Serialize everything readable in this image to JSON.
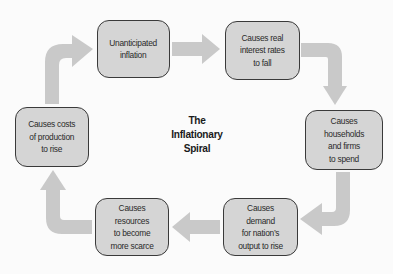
{
  "diagram": {
    "title_lines": [
      "The",
      "Inflationary",
      "Spiral"
    ],
    "type": "cycle",
    "colors": {
      "background": "#fbfbfb",
      "box_fill": "#d5d5d5",
      "box_border": "#3a3a3a",
      "arrow_fill": "#c9c9c9",
      "text": "#2a2a2a"
    },
    "nodes": [
      {
        "id": "unanticipated-inflation",
        "lines": [
          "Unanticipated",
          "inflation"
        ]
      },
      {
        "id": "real-interest-rates-fall",
        "lines": [
          "Causes real",
          "interest rates",
          "to fall"
        ]
      },
      {
        "id": "households-firms-spend",
        "lines": [
          "Causes households",
          "and firms",
          "to spend"
        ]
      },
      {
        "id": "demand-output-rise",
        "lines": [
          "Causes demand",
          "for nation’s",
          "output to rise"
        ]
      },
      {
        "id": "resources-scarce",
        "lines": [
          "Causes resources",
          "to become",
          "more scarce"
        ]
      },
      {
        "id": "costs-production-rise",
        "lines": [
          "Causes costs",
          "of production",
          "to rise"
        ]
      }
    ],
    "edges": [
      {
        "from": "unanticipated-inflation",
        "to": "real-interest-rates-fall"
      },
      {
        "from": "real-interest-rates-fall",
        "to": "households-firms-spend"
      },
      {
        "from": "households-firms-spend",
        "to": "demand-output-rise"
      },
      {
        "from": "demand-output-rise",
        "to": "resources-scarce"
      },
      {
        "from": "resources-scarce",
        "to": "costs-production-rise"
      },
      {
        "from": "costs-production-rise",
        "to": "unanticipated-inflation"
      }
    ]
  }
}
